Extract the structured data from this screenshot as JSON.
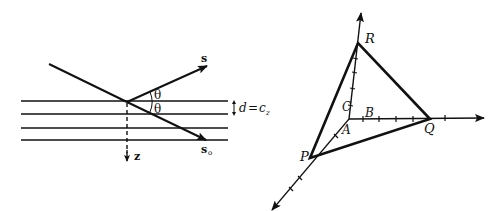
{
  "left_diagram": {
    "title": "Diffraction from lattice planes",
    "labels": {
      "reflected_vector": "s",
      "incident_vector": "s",
      "incident_subscript": "o",
      "angle_upper": "θ",
      "angle_lower": "θ",
      "spacing_lhs": "d",
      "spacing_eq": "=",
      "spacing_rhs": "c",
      "spacing_rhs_sub": "z",
      "depth_axis": "z"
    },
    "plane_count": 4
  },
  "right_diagram": {
    "title": "Plane intercepting coordinate axes",
    "labels": {
      "origin": "A",
      "point_on_x": "B",
      "point_on_z": "C",
      "vertex_p": "P",
      "vertex_q": "Q",
      "vertex_r": "R"
    }
  },
  "colors": {
    "ink": "#111111",
    "background": "#ffffff"
  }
}
